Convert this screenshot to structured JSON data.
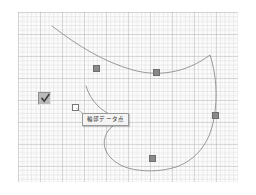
{
  "app": {
    "title": "Spline Curve Editor Canvas",
    "background_color": "#ffffff"
  },
  "canvas": {
    "name": "graph-paper-canvas",
    "x": 18,
    "y": 12,
    "width": 220,
    "height": 170,
    "grid": {
      "minor_spacing_px": 4.4,
      "major_spacing_px": 22,
      "minor_color": "#b9b9b9",
      "major_color": "#a0a0a0",
      "background_color": "#fcfcfc"
    }
  },
  "curve": {
    "name": "freeform-spline",
    "stroke_color": "#8d8d93",
    "stroke_width": 0.9,
    "fill": "none",
    "path": "M 52 26 C 78 46 104 62 133 70 C 158 77 186 73 210 55 C 216 73 218 96 214 118 C 210 143 196 160 176 167 C 160 172 142 172 128 168 C 118 165 110 159 106 151 C 103 144 104 137 108 131 C 113 124 120 122 124 120 C 114 117 104 112 98 106 C 92 100 88 93 86 86"
  },
  "control_points": [
    {
      "name": "control-point-1",
      "x": 96,
      "y": 68,
      "label": "p1"
    },
    {
      "name": "control-point-2",
      "x": 156,
      "y": 72,
      "label": "p2"
    },
    {
      "name": "control-point-3",
      "x": 215,
      "y": 115,
      "label": "p3"
    },
    {
      "name": "control-point-4",
      "x": 152,
      "y": 158,
      "label": "p4"
    }
  ],
  "cursor_marker": {
    "name": "hollow-square-cursor",
    "x": 72,
    "y": 104
  },
  "checkbox": {
    "name": "display-toggle-checkbox",
    "checked": true,
    "x": 38,
    "y": 92,
    "size": 13,
    "face_color": "#b9b9b9",
    "tick_color": "#3a3a3a"
  },
  "tooltip": {
    "name": "data-point-tooltip",
    "text": "輪郭データ点",
    "x": 82,
    "y": 113,
    "background_color": "#f4f4f4",
    "border_color": "#9a9a9a",
    "text_color": "#2b2b2b"
  }
}
